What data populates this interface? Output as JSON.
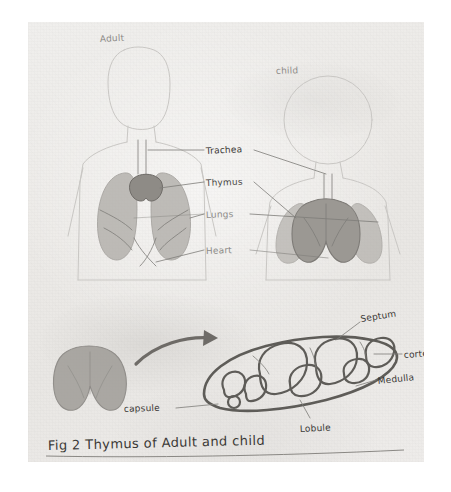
{
  "figure": {
    "medium": "pencil-drawing-on-paper",
    "caption": "Fig 2   Thymus  of  Adult  and  child",
    "caption_parts": {
      "fig_number": "Fig 2",
      "subject": "Thymus",
      "connector": "of",
      "subject_a": "Adult",
      "conjunction": "and",
      "subject_b": "child"
    },
    "colors": {
      "paper": "#ecebe8",
      "page_background": "#ffffff",
      "pencil_dark": "#3a3835",
      "pencil_mid": "#7e7c79",
      "pencil_faint": "#c9c7c4",
      "organ_shade": "#9b9893"
    }
  },
  "panels": {
    "top": {
      "name": "body-comparison-panel",
      "subjects": [
        {
          "id": "adult",
          "label": "Adult"
        },
        {
          "id": "child",
          "label": "child"
        }
      ],
      "callouts": [
        {
          "id": "trachea",
          "label": "Trachea"
        },
        {
          "id": "thymus",
          "label": "Thymus"
        },
        {
          "id": "lungs",
          "label": "Lungs"
        },
        {
          "id": "heart",
          "label": "Heart"
        }
      ]
    },
    "bottom": {
      "name": "thymus-section-panel",
      "whole_organ_label": "",
      "callouts": [
        {
          "id": "septum",
          "label": "Septum"
        },
        {
          "id": "cortex",
          "label": "cortex"
        },
        {
          "id": "medulla",
          "label": "Medulla"
        },
        {
          "id": "lobule",
          "label": "Lobule"
        },
        {
          "id": "capsule",
          "label": "capsule"
        }
      ]
    }
  }
}
